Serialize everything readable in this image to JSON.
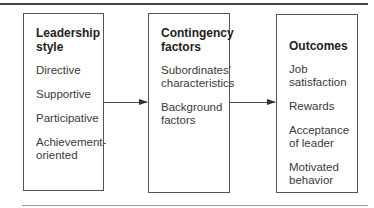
{
  "diagram": {
    "boxes": [
      {
        "title": "Leadership\nstyle",
        "items": [
          "Directive",
          "Supportive",
          "Participative",
          "Achievement-\noriented"
        ]
      },
      {
        "title": "Contingency\nfactors",
        "items": [
          "Subordinates'\ncharacteristics",
          "Background\nfactors"
        ]
      },
      {
        "title": "Outcomes",
        "items": [
          "Job\nsatisfaction",
          "Rewards",
          "Acceptance\nof leader",
          "Motivated\nbehavior"
        ]
      }
    ],
    "arrows": [
      {
        "from": "Leadership style",
        "to": "Contingency factors"
      },
      {
        "from": "Contingency factors",
        "to": "Outcomes"
      }
    ]
  }
}
